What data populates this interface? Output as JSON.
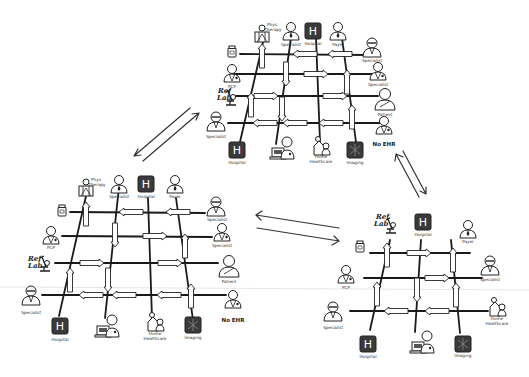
{
  "diagram": {
    "title": "",
    "connectors": [
      {
        "from": "grid-top",
        "to": "grid-left",
        "direction": "bidirectional"
      },
      {
        "from": "grid-top",
        "to": "grid-right",
        "direction": "bidirectional"
      },
      {
        "from": "grid-left",
        "to": "grid-right",
        "direction": "bidirectional"
      }
    ],
    "grids": [
      {
        "id": "grid-top",
        "nodes_top": [
          {
            "label": "Phys Therapy",
            "icon": "physical-therapy-icon"
          },
          {
            "label": "Specialist",
            "icon": "person-icon"
          },
          {
            "label": "Hospital",
            "icon": "hospital-icon"
          },
          {
            "label": "Payer",
            "icon": "person-icon"
          }
        ],
        "nodes_left": [
          {
            "label": "",
            "icon": "pharmacy-bottle-icon"
          },
          {
            "label": "PCP",
            "icon": "doctor-icon"
          },
          {
            "label": "Ref Lab",
            "icon": "microscope-icon"
          },
          {
            "label": "Specialist",
            "icon": "doctor-icon"
          }
        ],
        "nodes_right": [
          {
            "label": "Specialist",
            "icon": "person-icon"
          },
          {
            "label": "Specialist",
            "icon": "doctor-icon"
          },
          {
            "label": "Patient",
            "icon": "patient-icon"
          },
          {
            "label": "No EHR",
            "icon": "doctor-icon"
          }
        ],
        "nodes_bottom": [
          {
            "label": "Hospital",
            "icon": "hospital-icon"
          },
          {
            "label": "",
            "icon": "computer-doctor-icon"
          },
          {
            "label": "Home Healthcare",
            "icon": "home-healthcare-icon"
          },
          {
            "label": "Imaging",
            "icon": "imaging-icon"
          }
        ]
      },
      {
        "id": "grid-left",
        "nodes_top": [
          {
            "label": "Phys Therapy",
            "icon": "physical-therapy-icon"
          },
          {
            "label": "Specialist",
            "icon": "person-icon"
          },
          {
            "label": "Hospital",
            "icon": "hospital-icon"
          },
          {
            "label": "Payer",
            "icon": "person-icon"
          }
        ],
        "nodes_left": [
          {
            "label": "",
            "icon": "pharmacy-bottle-icon"
          },
          {
            "label": "PCP",
            "icon": "doctor-icon"
          },
          {
            "label": "Ref Lab",
            "icon": "microscope-icon"
          },
          {
            "label": "Specialist",
            "icon": "doctor-icon"
          }
        ],
        "nodes_right": [
          {
            "label": "Specialist",
            "icon": "person-icon"
          },
          {
            "label": "Specialist",
            "icon": "doctor-icon"
          },
          {
            "label": "Patient",
            "icon": "patient-icon"
          },
          {
            "label": "No EHR",
            "icon": "doctor-icon"
          }
        ],
        "nodes_bottom": [
          {
            "label": "Hospital",
            "icon": "hospital-icon"
          },
          {
            "label": "",
            "icon": "computer-doctor-icon"
          },
          {
            "label": "Home Healthcare",
            "icon": "home-healthcare-icon"
          },
          {
            "label": "Imaging",
            "icon": "imaging-icon"
          }
        ]
      },
      {
        "id": "grid-right",
        "nodes_top": [
          {
            "label": "Ref Lab",
            "icon": "microscope-icon"
          },
          {
            "label": "Hospital",
            "icon": "hospital-icon"
          },
          {
            "label": "Payer",
            "icon": "person-icon"
          }
        ],
        "nodes_left": [
          {
            "label": "",
            "icon": "pharmacy-bottle-icon"
          },
          {
            "label": "PCP",
            "icon": "doctor-icon"
          },
          {
            "label": "Specialist",
            "icon": "doctor-icon"
          }
        ],
        "nodes_right": [
          {
            "label": "Specialist",
            "icon": "person-icon"
          },
          {
            "label": "Home Healthcare",
            "icon": "home-healthcare-icon"
          }
        ],
        "nodes_bottom": [
          {
            "label": "Hospital",
            "icon": "hospital-icon"
          },
          {
            "label": "",
            "icon": "computer-doctor-icon"
          },
          {
            "label": "Imaging",
            "icon": "imaging-icon"
          }
        ]
      }
    ],
    "labels": {
      "phys_therapy_1": "Phys",
      "phys_therapy_2": "Therapy",
      "specialist": "Specialist",
      "hospital": "Hospital",
      "payer": "Payer",
      "pcp": "PCP",
      "ref": "Ref",
      "lab": "Lab",
      "patient": "Patient",
      "no_ehr": "No EHR",
      "home": "Home",
      "healthcare": "Healthcare",
      "imaging": "Imaging",
      "h": "H"
    }
  }
}
